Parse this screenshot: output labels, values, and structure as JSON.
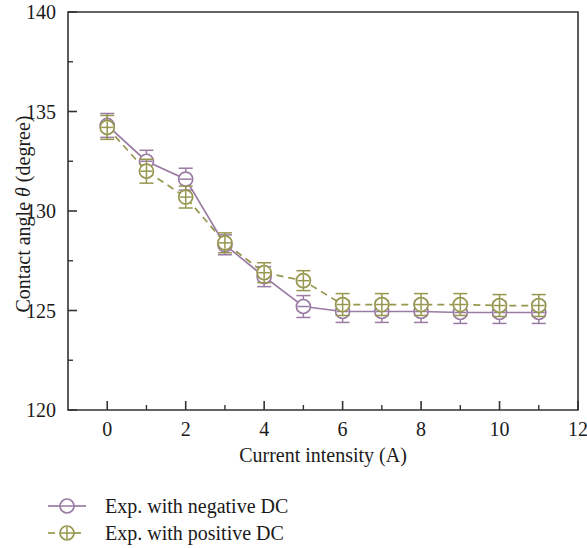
{
  "chart_data": {
    "type": "line",
    "title": "",
    "xlabel": "Current intensity (A)",
    "ylabel_prefix": "Contact angle ",
    "ylabel_symbol": "θ",
    "ylabel_suffix": " (degree)",
    "ylabel_full": "Contact angle θ (degree)",
    "xlim": [
      -1,
      12
    ],
    "ylim": [
      120,
      140
    ],
    "x_major_ticks": [
      0,
      2,
      4,
      6,
      8,
      10,
      12
    ],
    "x_major_tick_labels": [
      "0",
      "2",
      "4",
      "6",
      "8",
      "10",
      "12"
    ],
    "x_minor_ticks": [
      1,
      3,
      5,
      7,
      9,
      11
    ],
    "y_major_ticks": [
      120,
      125,
      130,
      135,
      140
    ],
    "y_major_tick_labels": [
      "120",
      "125",
      "130",
      "135",
      "140"
    ],
    "y_minor_ticks": [
      122.5,
      127.5,
      132.5,
      137.5
    ],
    "grid": false,
    "legend_position": "below-left",
    "x": [
      0,
      1,
      2,
      3,
      4,
      5,
      6,
      7,
      8,
      9,
      10,
      11
    ],
    "series": [
      {
        "name": "Exp. with negative DC",
        "color": "#9a7ba3",
        "linestyle": "solid",
        "marker": "circle-minus",
        "marker_symbol": "⊖",
        "values": [
          134.3,
          132.5,
          131.6,
          128.3,
          126.7,
          125.2,
          124.95,
          124.95,
          124.95,
          124.9,
          124.9,
          124.9
        ],
        "errors": [
          0.6,
          0.55,
          0.55,
          0.5,
          0.5,
          0.55,
          0.55,
          0.55,
          0.55,
          0.55,
          0.55,
          0.55
        ]
      },
      {
        "name": "Exp. with positive DC",
        "color": "#96974f",
        "linestyle": "dashed",
        "marker": "circle-plus",
        "marker_symbol": "⊕",
        "values": [
          134.2,
          132.0,
          130.7,
          128.4,
          126.9,
          126.5,
          125.3,
          125.3,
          125.3,
          125.3,
          125.25,
          125.25
        ],
        "errors": [
          0.6,
          0.6,
          0.55,
          0.5,
          0.5,
          0.5,
          0.55,
          0.55,
          0.55,
          0.55,
          0.55,
          0.55
        ]
      }
    ]
  },
  "legend": {
    "items": [
      {
        "label": "Exp. with negative DC",
        "color": "#9a7ba3",
        "marker_symbol": "⊖",
        "linestyle": "solid"
      },
      {
        "label": "Exp. with positive DC",
        "color": "#96974f",
        "marker_symbol": "⊕",
        "linestyle": "dashed"
      }
    ]
  }
}
